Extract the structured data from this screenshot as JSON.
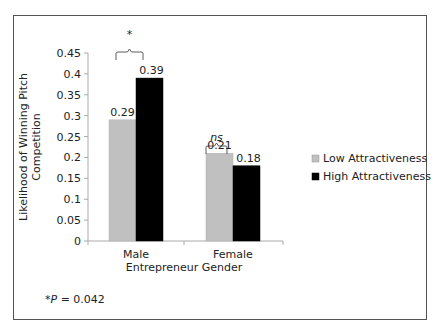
{
  "chart_data": {
    "type": "bar",
    "title": "",
    "xlabel": "Entrepreneur Gender",
    "ylabel": "Likelihood of Winning Pitch Competition",
    "ylabel_lines": [
      "Likelihood of Winning Pitch",
      "Competition"
    ],
    "categories": [
      "Male",
      "Female"
    ],
    "series": [
      {
        "name": "Low Attractiveness",
        "values": [
          0.29,
          0.21
        ],
        "color": "#c0c0c0"
      },
      {
        "name": "High Attractiveness",
        "values": [
          0.39,
          0.18
        ],
        "color": "#000000"
      }
    ],
    "data_labels": [
      [
        "0.29",
        "0.21"
      ],
      [
        "0.39",
        "0.18"
      ]
    ],
    "ylim": [
      0,
      0.45
    ],
    "yticks": [
      "0",
      "0.05",
      "0.1",
      "0.15",
      "0.2",
      "0.25",
      "0.3",
      "0.35",
      "0.4",
      "0.45"
    ],
    "grid": false,
    "legend_position": "right",
    "annotations": [
      {
        "category": "Male",
        "label": "*"
      },
      {
        "category": "Female",
        "label": "ns"
      }
    ],
    "footnote": "*P = 0.042"
  },
  "footnote": {
    "prefix": "*",
    "p": "P",
    "rest": " = 0.042"
  }
}
